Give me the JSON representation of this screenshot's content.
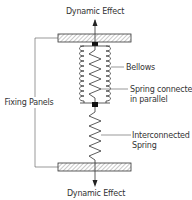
{
  "diagram": {
    "labels": {
      "top_effect": "Dynamic Effect",
      "bottom_effect": "Dynamic Effect",
      "fixing_panels": "Fixing Panels",
      "bellows": "Bellows",
      "spring_parallel_line1": "Spring connected",
      "spring_parallel_line2": "in parallel",
      "interconnected_line1": "Interconnected",
      "interconnected_line2": "Spring"
    },
    "components": [
      "top-fixing-panel",
      "bellows",
      "parallel-spring",
      "interconnected-spring",
      "bottom-fixing-panel"
    ]
  }
}
